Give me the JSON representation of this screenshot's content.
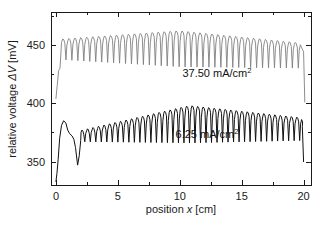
{
  "chart_data": {
    "type": "line",
    "title": "",
    "xlabel": "position x [cm]",
    "ylabel": "relative voltage ΔV [mV]",
    "xlim": [
      -0.4,
      20.6
    ],
    "ylim": [
      330,
      478
    ],
    "grid": false,
    "legend_position": "inline-annotation",
    "xticks": [
      0,
      5,
      10,
      15,
      20
    ],
    "xtick_labels": [
      "0",
      "5",
      "10",
      "15",
      "20"
    ],
    "yticks": [
      350,
      400,
      450
    ],
    "ytick_labels": [
      "350",
      "400",
      "450"
    ],
    "y_minor_ticks": [
      325,
      375,
      425,
      475
    ],
    "x_minor_ticks": [
      2.5,
      7.5,
      12.5,
      17.5
    ],
    "series": [
      {
        "name": "37.50 mA/cm2",
        "annotation": "37.50 mA/cm",
        "annotation_superscript": "2",
        "color": "#808080",
        "annotation_x": 13.0,
        "annotation_y": 422.0,
        "oscillation_cycles": 40,
        "baseline_start": 455,
        "baseline_mid": 462,
        "baseline_end": 452,
        "spike_depth_start": 18,
        "spike_depth_mid": 31,
        "spike_depth_end": 22,
        "lead_in_value": 404,
        "lead_out_value": 401,
        "x_start": 0.0,
        "x_osc_start": 0.45,
        "x_osc_end": 19.7,
        "x_end": 20.1
      },
      {
        "name": "6.25 mA/cm2",
        "annotation": "6.25 mA/cm",
        "annotation_superscript": "2",
        "color": "#111111",
        "annotation_x": 12.2,
        "annotation_y": 370.0,
        "oscillation_cycles": 40,
        "baseline_start": 377,
        "baseline_mid": 398,
        "baseline_end": 388,
        "spike_depth_start": 10,
        "spike_depth_mid": 32,
        "spike_depth_end": 20,
        "lead_in_value": 333,
        "initial_bump_peak": 385,
        "initial_bump_x": 0.62,
        "initial_dip_value": 347,
        "initial_dip_x": 1.75,
        "lead_out_value": 350,
        "x_start": 0.0,
        "x_osc_start": 2.0,
        "x_osc_end": 19.8,
        "x_end": 20.0
      }
    ],
    "axis_color": "#1a1a1a",
    "background": "#ffffff"
  },
  "figure": {
    "plot_area": {
      "left": 51,
      "top": 12,
      "right": 311,
      "bottom": 185
    }
  }
}
